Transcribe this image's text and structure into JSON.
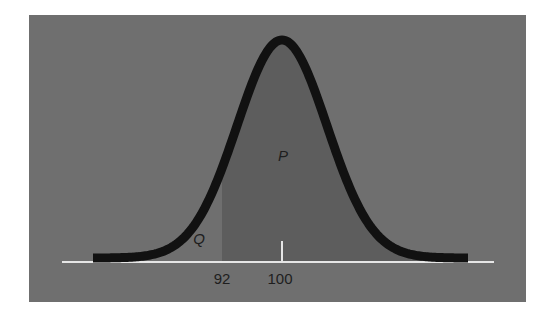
{
  "chart_data": {
    "type": "area",
    "title": "",
    "distribution": {
      "mean": 100,
      "sd": 6
    },
    "xlabel": "",
    "ylabel": "",
    "x_ticks": [
      {
        "value": 92,
        "label": "92"
      },
      {
        "value": 100,
        "label": "100"
      }
    ],
    "regions": [
      {
        "label": "Q",
        "from": "-inf",
        "to": 92,
        "shaded": false
      },
      {
        "label": "P",
        "from": 92,
        "to": "+inf",
        "shaded": true
      }
    ],
    "grid": false,
    "legend": null
  },
  "labels": {
    "q": "Q",
    "p": "P",
    "tick_92": "92",
    "tick_100": "100"
  },
  "colors": {
    "panel": "#6f6f6f",
    "shaded": "#5d5d5d",
    "curve": "#111111",
    "axis": "#e6e6e6",
    "text": "#1e1e1e"
  }
}
